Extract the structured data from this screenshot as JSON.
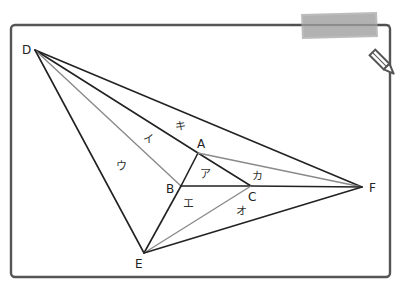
{
  "diagram": {
    "type": "geometry-figure",
    "vertices": [
      {
        "id": "D",
        "label": "D",
        "x": 35,
        "y": 50,
        "lx": 22,
        "ly": 54
      },
      {
        "id": "A",
        "label": "A",
        "x": 198,
        "y": 153,
        "lx": 197,
        "ly": 148
      },
      {
        "id": "B",
        "label": "B",
        "x": 181,
        "y": 186,
        "lx": 166,
        "ly": 193
      },
      {
        "id": "C",
        "label": "C",
        "x": 251,
        "y": 186,
        "lx": 248,
        "ly": 201
      },
      {
        "id": "E",
        "label": "E",
        "x": 144,
        "y": 253,
        "lx": 135,
        "ly": 268
      },
      {
        "id": "F",
        "label": "F",
        "x": 362,
        "y": 187,
        "lx": 369,
        "ly": 192
      }
    ],
    "edges": [
      {
        "from": "D",
        "to": "F",
        "style": "dark"
      },
      {
        "from": "D",
        "to": "A",
        "style": "dark"
      },
      {
        "from": "D",
        "to": "B",
        "style": "gray"
      },
      {
        "from": "D",
        "to": "E",
        "style": "dark"
      },
      {
        "from": "A",
        "to": "B",
        "style": "dark"
      },
      {
        "from": "A",
        "to": "C",
        "style": "dark"
      },
      {
        "from": "A",
        "to": "F",
        "style": "gray"
      },
      {
        "from": "B",
        "to": "C",
        "style": "dark"
      },
      {
        "from": "C",
        "to": "F",
        "style": "dark"
      },
      {
        "from": "B",
        "to": "E",
        "style": "dark"
      },
      {
        "from": "C",
        "to": "E",
        "style": "gray"
      },
      {
        "from": "E",
        "to": "F",
        "style": "dark"
      }
    ],
    "regions": [
      {
        "id": "a",
        "label": "ア",
        "x": 205,
        "y": 178
      },
      {
        "id": "i",
        "label": "イ",
        "x": 148,
        "y": 143
      },
      {
        "id": "u",
        "label": "ウ",
        "x": 121,
        "y": 170
      },
      {
        "id": "e",
        "label": "エ",
        "x": 188,
        "y": 207
      },
      {
        "id": "o",
        "label": "オ",
        "x": 241,
        "y": 215
      },
      {
        "id": "ka",
        "label": "カ",
        "x": 257,
        "y": 180
      },
      {
        "id": "ki",
        "label": "キ",
        "x": 180,
        "y": 130
      }
    ],
    "decorations": {
      "tape": "masking-tape",
      "pencil": "pencil-icon"
    },
    "colors": {
      "dark_line": "#222222",
      "gray_line": "#8a8a8a",
      "frame": "#555555",
      "tape": "#b5b5b5"
    }
  }
}
